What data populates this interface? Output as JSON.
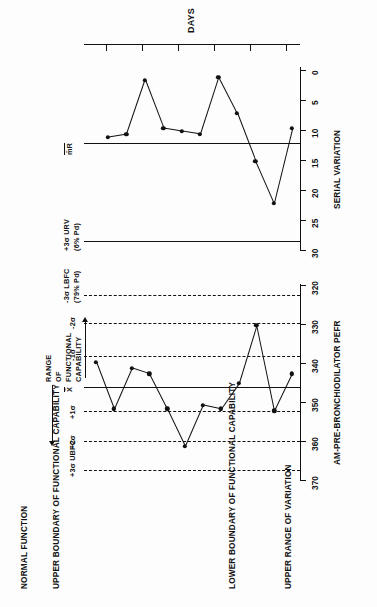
{
  "figure": {
    "headings": {
      "normal_function": "NORMAL FUNCTION",
      "upper_boundary": "UPPER BOUNDARY OF FUNCTIONAL CAPABILITY",
      "lower_boundary": "LOWER BOUNDARY OF FUNCTIONAL CAPABILITY",
      "upper_range_variation": "UPPER RANGE OF VARIATION"
    },
    "range_annotation": {
      "line1": "RANGE",
      "line2": "OF",
      "line3": "FUNCTIONAL",
      "line4": "CAPABILITY"
    }
  },
  "chart_data": [
    {
      "type": "line",
      "id": "individuals-chart",
      "title": "AM-PRE-BRONCHIODILATOR PEFR",
      "xlabel": "DAYS",
      "ylabel": "AM-PRE-BRONCHIODILATOR PEFR",
      "ylim": [
        320,
        370
      ],
      "yticks": [
        370,
        360,
        350,
        340,
        330,
        320
      ],
      "ytick_labels": [
        "370",
        "360",
        "350",
        "340",
        "330",
        "320"
      ],
      "grid": false,
      "legend": "none",
      "x": [
        1,
        2,
        3,
        4,
        5,
        6,
        7,
        8,
        9,
        10,
        11,
        12
      ],
      "values": [
        339.5,
        351.5,
        341.0,
        342.5,
        351.5,
        361.0,
        350.5,
        351.5,
        345.0,
        330.0,
        352.0,
        342.5
      ],
      "control_lines": [
        {
          "label": "+3σ UBFC",
          "value": 366.0,
          "style": "dashed"
        },
        {
          "label": "+2σ",
          "value": 359.8,
          "style": "dashed"
        },
        {
          "label": "+1σ",
          "value": 353.0,
          "style": "dashed"
        },
        {
          "label": "X̄",
          "value": 346.5,
          "style": "solid"
        },
        {
          "label": "-1σ",
          "value": 339.5,
          "style": "dashed"
        },
        {
          "label": "-2σ",
          "value": 330.0,
          "style": "dashed"
        },
        {
          "label": "-3σ LBFC",
          "value": 323.0,
          "style": "dashed",
          "sublabel": "(79% Pd)"
        }
      ]
    },
    {
      "type": "line",
      "id": "moving-range-chart",
      "title": "SERIAL VARIATION",
      "xlabel": "DAYS",
      "ylabel": "SERIAL VARIATION",
      "ylim": [
        0,
        30
      ],
      "yticks": [
        30,
        25,
        20,
        15,
        10,
        5,
        0
      ],
      "ytick_labels": [
        "30",
        "25",
        "20",
        "15",
        "10",
        "5",
        "0"
      ],
      "grid": false,
      "legend": "none",
      "x": [
        2,
        3,
        4,
        5,
        6,
        7,
        8,
        9,
        10,
        11,
        12
      ],
      "values": [
        11.0,
        10.5,
        1.5,
        9.5,
        10.0,
        10.5,
        1.0,
        7.0,
        15.0,
        22.0,
        9.5
      ],
      "control_lines": [
        {
          "label": "+3σ URV",
          "value": 27.0,
          "style": "solid",
          "sublabel": "(6% Pd)"
        },
        {
          "label": "m̄R",
          "value": 8.5,
          "style": "solid"
        }
      ]
    }
  ],
  "axis_labels": {
    "days": "DAYS",
    "pefr": "AM-PRE-BRONCHIODILATOR PEFR",
    "serial_variation": "SERIAL VARIATION"
  },
  "sigma_labels": {
    "p3_ubfc": "+3σ UBFC",
    "p2": "+2σ",
    "p1": "+1σ",
    "xbar": "X̄",
    "m1": "-1σ",
    "m2": "-2σ",
    "m3_lbfc": "-3σ LBFC",
    "m3_lbfc_sub": "(79% Pd)",
    "urv": "+3σ URV",
    "urv_sub": "(6% Pd)",
    "mrbar": "m̄R"
  }
}
